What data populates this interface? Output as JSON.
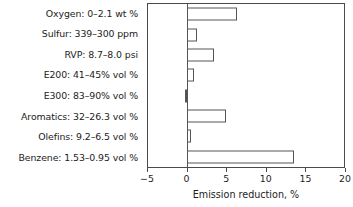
{
  "chart_data": {
    "type": "bar",
    "orientation": "horizontal",
    "title": "",
    "xlabel": "Emission reduction, %",
    "ylabel": "",
    "xlim": [
      -5,
      20
    ],
    "xticks": [
      -5,
      0,
      5,
      10,
      15,
      20
    ],
    "xticklabels": [
      "-5",
      "0",
      "5",
      "10",
      "15",
      "20"
    ],
    "grid": false,
    "legend": null,
    "bar_facecolor": "#ffffff",
    "bar_edgecolor": "#555555",
    "axis_color": "#4a4a4a",
    "categories": [
      "Oxygen: 0–2.1 wt %",
      "Sulfur: 339–300 ppm",
      "RVP: 8.7–8.0 psi",
      "E200: 41–45% vol %",
      "E300: 83–90% vol %",
      "Aromatics: 32–26.3 vol %",
      "Olefins: 9.2–6.5 vol %",
      "Benzene: 1.53–0.95 vol %"
    ],
    "values": [
      6.3,
      1.2,
      3.4,
      0.9,
      -0.3,
      5.0,
      0.5,
      13.6
    ]
  }
}
